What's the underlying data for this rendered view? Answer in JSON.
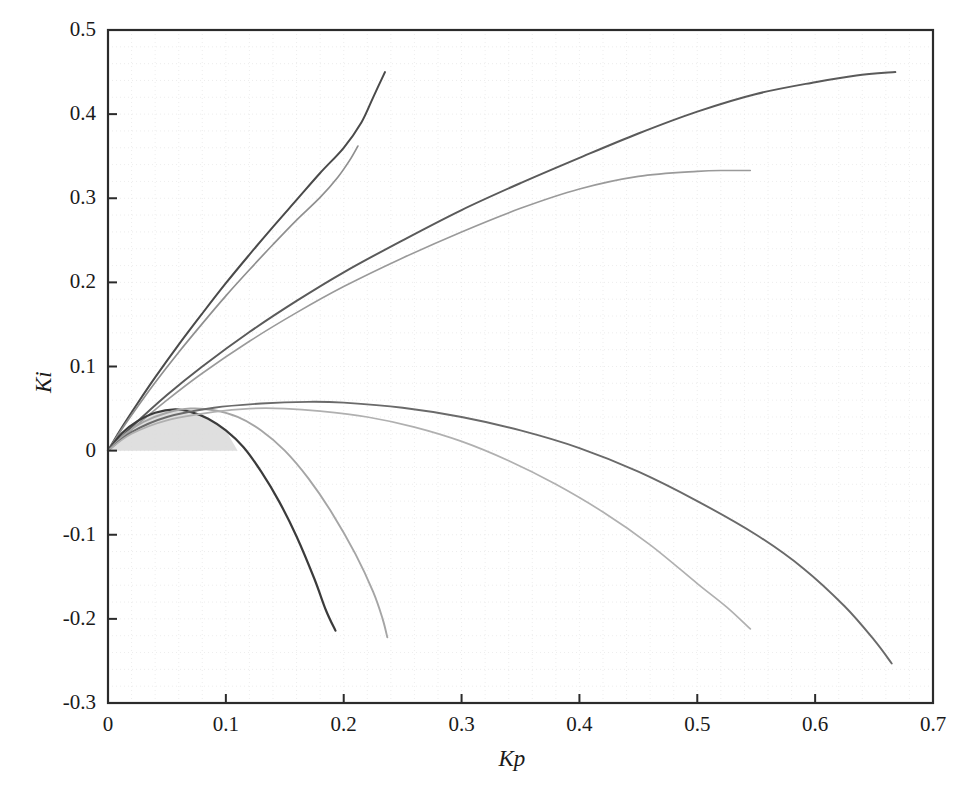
{
  "chart_data": {
    "type": "line",
    "title": "",
    "xlabel": "Kp",
    "ylabel": "Ki",
    "xlim": [
      0,
      0.7
    ],
    "ylim": [
      -0.3,
      0.5
    ],
    "xticks": [
      "0",
      "0.1",
      "0.2",
      "0.3",
      "0.4",
      "0.5",
      "0.6",
      "0.7"
    ],
    "xtick_values": [
      0,
      0.1,
      0.2,
      0.3,
      0.4,
      0.5,
      0.6,
      0.7
    ],
    "yticks": [
      "0.5",
      "0.4",
      "0.3",
      "0.2",
      "0.1",
      "0",
      "-0.1",
      "-0.2",
      "-0.3"
    ],
    "ytick_values": [
      0.5,
      0.4,
      0.3,
      0.2,
      0.1,
      0,
      -0.1,
      -0.2,
      -0.3
    ],
    "grid": true,
    "grid_style": "faint dotted",
    "legend": "none",
    "background_color": "#ffffff",
    "axis_color": "#2b2b2b",
    "shaded_region": {
      "name": "stability-region",
      "color": "#d9d9d9",
      "description": "grey filled region between the narrow arch curve and the Ki = 0 axis from Kp = 0 to Kp = 0.11",
      "x_range": [
        0,
        0.11
      ],
      "y_range": [
        0,
        0.05
      ]
    },
    "series": [
      {
        "name": "steep-rise-dark",
        "color": "#4a4a4a",
        "width": 2.0,
        "points": [
          [
            0,
            0
          ],
          [
            0.012,
            0.028
          ],
          [
            0.025,
            0.056
          ],
          [
            0.04,
            0.087
          ],
          [
            0.06,
            0.126
          ],
          [
            0.08,
            0.163
          ],
          [
            0.1,
            0.199
          ],
          [
            0.12,
            0.233
          ],
          [
            0.14,
            0.266
          ],
          [
            0.16,
            0.298
          ],
          [
            0.18,
            0.33
          ],
          [
            0.2,
            0.36
          ],
          [
            0.215,
            0.39
          ],
          [
            0.225,
            0.42
          ],
          [
            0.235,
            0.45
          ]
        ]
      },
      {
        "name": "steep-rise-light",
        "color": "#8f8f8f",
        "width": 1.7,
        "points": [
          [
            0,
            0
          ],
          [
            0.012,
            0.026
          ],
          [
            0.025,
            0.052
          ],
          [
            0.04,
            0.081
          ],
          [
            0.06,
            0.117
          ],
          [
            0.08,
            0.151
          ],
          [
            0.1,
            0.184
          ],
          [
            0.12,
            0.215
          ],
          [
            0.14,
            0.245
          ],
          [
            0.16,
            0.274
          ],
          [
            0.18,
            0.301
          ],
          [
            0.195,
            0.325
          ],
          [
            0.205,
            0.345
          ],
          [
            0.212,
            0.362
          ]
        ]
      },
      {
        "name": "shallow-rise-dark",
        "color": "#5a5a5a",
        "width": 2.0,
        "points": [
          [
            0,
            0
          ],
          [
            0.02,
            0.028
          ],
          [
            0.05,
            0.066
          ],
          [
            0.08,
            0.1
          ],
          [
            0.12,
            0.141
          ],
          [
            0.16,
            0.178
          ],
          [
            0.2,
            0.212
          ],
          [
            0.25,
            0.25
          ],
          [
            0.3,
            0.286
          ],
          [
            0.35,
            0.318
          ],
          [
            0.4,
            0.348
          ],
          [
            0.45,
            0.377
          ],
          [
            0.5,
            0.403
          ],
          [
            0.55,
            0.424
          ],
          [
            0.6,
            0.438
          ],
          [
            0.635,
            0.446
          ],
          [
            0.668,
            0.45
          ]
        ]
      },
      {
        "name": "shallow-rise-light",
        "color": "#9a9a9a",
        "width": 1.6,
        "points": [
          [
            0,
            0
          ],
          [
            0.02,
            0.025
          ],
          [
            0.05,
            0.06
          ],
          [
            0.08,
            0.092
          ],
          [
            0.12,
            0.13
          ],
          [
            0.16,
            0.164
          ],
          [
            0.2,
            0.195
          ],
          [
            0.25,
            0.229
          ],
          [
            0.3,
            0.26
          ],
          [
            0.35,
            0.288
          ],
          [
            0.4,
            0.311
          ],
          [
            0.45,
            0.326
          ],
          [
            0.5,
            0.332
          ],
          [
            0.525,
            0.333
          ],
          [
            0.545,
            0.333
          ]
        ]
      },
      {
        "name": "narrow-arch-dark",
        "color": "#3b3b3b",
        "width": 2.2,
        "points": [
          [
            0,
            0
          ],
          [
            0.012,
            0.021
          ],
          [
            0.025,
            0.035
          ],
          [
            0.04,
            0.045
          ],
          [
            0.057,
            0.049
          ],
          [
            0.07,
            0.046
          ],
          [
            0.085,
            0.038
          ],
          [
            0.1,
            0.024
          ],
          [
            0.115,
            0.004
          ],
          [
            0.13,
            -0.025
          ],
          [
            0.145,
            -0.06
          ],
          [
            0.16,
            -0.102
          ],
          [
            0.175,
            -0.152
          ],
          [
            0.185,
            -0.19
          ],
          [
            0.193,
            -0.214
          ]
        ]
      },
      {
        "name": "narrow-arch-light",
        "color": "#a5a5a5",
        "width": 1.9,
        "points": [
          [
            0,
            0
          ],
          [
            0.015,
            0.02
          ],
          [
            0.03,
            0.034
          ],
          [
            0.05,
            0.045
          ],
          [
            0.07,
            0.05
          ],
          [
            0.09,
            0.048
          ],
          [
            0.11,
            0.04
          ],
          [
            0.13,
            0.024
          ],
          [
            0.15,
            0.0
          ],
          [
            0.17,
            -0.033
          ],
          [
            0.19,
            -0.074
          ],
          [
            0.21,
            -0.123
          ],
          [
            0.225,
            -0.168
          ],
          [
            0.233,
            -0.2
          ],
          [
            0.237,
            -0.222
          ]
        ]
      },
      {
        "name": "wide-arch-dark",
        "color": "#6a6a6a",
        "width": 1.9,
        "points": [
          [
            0,
            0
          ],
          [
            0.02,
            0.022
          ],
          [
            0.05,
            0.04
          ],
          [
            0.09,
            0.051
          ],
          [
            0.13,
            0.056
          ],
          [
            0.17,
            0.058
          ],
          [
            0.2,
            0.057
          ],
          [
            0.25,
            0.051
          ],
          [
            0.3,
            0.04
          ],
          [
            0.35,
            0.024
          ],
          [
            0.4,
            0.003
          ],
          [
            0.45,
            -0.025
          ],
          [
            0.5,
            -0.06
          ],
          [
            0.55,
            -0.1
          ],
          [
            0.59,
            -0.14
          ],
          [
            0.625,
            -0.185
          ],
          [
            0.65,
            -0.225
          ],
          [
            0.665,
            -0.253
          ]
        ]
      },
      {
        "name": "wide-arch-light",
        "color": "#b0b0b0",
        "width": 1.7,
        "points": [
          [
            0,
            0
          ],
          [
            0.02,
            0.02
          ],
          [
            0.05,
            0.036
          ],
          [
            0.09,
            0.046
          ],
          [
            0.12,
            0.05
          ],
          [
            0.15,
            0.05
          ],
          [
            0.18,
            0.047
          ],
          [
            0.22,
            0.04
          ],
          [
            0.26,
            0.028
          ],
          [
            0.3,
            0.011
          ],
          [
            0.34,
            -0.012
          ],
          [
            0.38,
            -0.04
          ],
          [
            0.42,
            -0.073
          ],
          [
            0.46,
            -0.112
          ],
          [
            0.5,
            -0.158
          ],
          [
            0.525,
            -0.186
          ],
          [
            0.545,
            -0.212
          ]
        ]
      }
    ]
  }
}
